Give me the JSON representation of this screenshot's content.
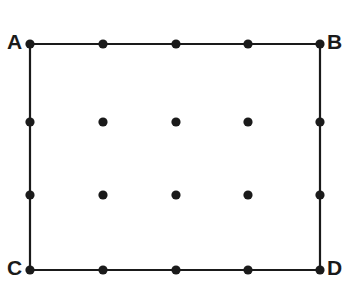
{
  "figure": {
    "kind": "geometry-diagram",
    "background_color": "#ffffff",
    "ink_color": "#1a1a1a",
    "canvas": {
      "width": 348,
      "height": 292
    },
    "rectangle": {
      "left": 30,
      "top": 44,
      "right": 320,
      "bottom": 270,
      "stroke_width": 2.2
    },
    "vertex_labels": [
      {
        "id": "A",
        "text": "A",
        "corner": "top-left",
        "x": 7,
        "y": 31
      },
      {
        "id": "B",
        "text": "B",
        "corner": "top-right",
        "x": 327,
        "y": 31
      },
      {
        "id": "C",
        "text": "C",
        "corner": "bottom-left",
        "x": 7,
        "y": 257
      },
      {
        "id": "D",
        "text": "D",
        "corner": "bottom-right",
        "x": 327,
        "y": 257
      }
    ],
    "grid": {
      "columns": 5,
      "rows": 4,
      "column_x": [
        30,
        103,
        176,
        248,
        320
      ],
      "row_y": [
        44,
        122,
        195,
        270
      ],
      "dot_radius": 4.6,
      "dot_color": "#1a1a1a"
    },
    "dots": [
      {
        "row": 0,
        "col": 0,
        "x": 30,
        "y": 44,
        "on_edge": true,
        "vertex": "A"
      },
      {
        "row": 0,
        "col": 1,
        "x": 103,
        "y": 44,
        "on_edge": true,
        "vertex": ""
      },
      {
        "row": 0,
        "col": 2,
        "x": 176,
        "y": 44,
        "on_edge": true,
        "vertex": ""
      },
      {
        "row": 0,
        "col": 3,
        "x": 248,
        "y": 44,
        "on_edge": true,
        "vertex": ""
      },
      {
        "row": 0,
        "col": 4,
        "x": 320,
        "y": 44,
        "on_edge": true,
        "vertex": "B"
      },
      {
        "row": 1,
        "col": 0,
        "x": 30,
        "y": 122,
        "on_edge": true,
        "vertex": ""
      },
      {
        "row": 1,
        "col": 1,
        "x": 103,
        "y": 122,
        "on_edge": false,
        "vertex": ""
      },
      {
        "row": 1,
        "col": 2,
        "x": 176,
        "y": 122,
        "on_edge": false,
        "vertex": ""
      },
      {
        "row": 1,
        "col": 3,
        "x": 248,
        "y": 122,
        "on_edge": false,
        "vertex": ""
      },
      {
        "row": 1,
        "col": 4,
        "x": 320,
        "y": 122,
        "on_edge": true,
        "vertex": ""
      },
      {
        "row": 2,
        "col": 0,
        "x": 30,
        "y": 195,
        "on_edge": true,
        "vertex": ""
      },
      {
        "row": 2,
        "col": 1,
        "x": 103,
        "y": 195,
        "on_edge": false,
        "vertex": ""
      },
      {
        "row": 2,
        "col": 2,
        "x": 176,
        "y": 195,
        "on_edge": false,
        "vertex": ""
      },
      {
        "row": 2,
        "col": 3,
        "x": 248,
        "y": 195,
        "on_edge": false,
        "vertex": ""
      },
      {
        "row": 2,
        "col": 4,
        "x": 320,
        "y": 195,
        "on_edge": true,
        "vertex": ""
      },
      {
        "row": 3,
        "col": 0,
        "x": 30,
        "y": 270,
        "on_edge": true,
        "vertex": "C"
      },
      {
        "row": 3,
        "col": 1,
        "x": 103,
        "y": 270,
        "on_edge": true,
        "vertex": ""
      },
      {
        "row": 3,
        "col": 2,
        "x": 176,
        "y": 270,
        "on_edge": true,
        "vertex": ""
      },
      {
        "row": 3,
        "col": 3,
        "x": 248,
        "y": 270,
        "on_edge": true,
        "vertex": ""
      },
      {
        "row": 3,
        "col": 4,
        "x": 320,
        "y": 270,
        "on_edge": true,
        "vertex": ""
      }
    ]
  }
}
